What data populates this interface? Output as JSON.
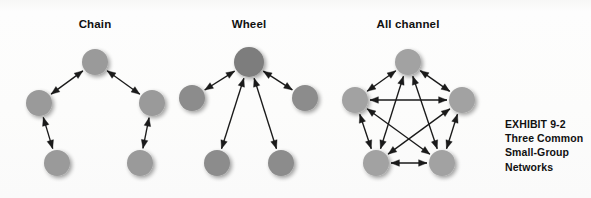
{
  "figure": {
    "caption_lines": [
      "EXHIBIT 9-2",
      "Three Common",
      "Small-Group",
      "Networks"
    ],
    "background_color": "#fbfbfa",
    "node_color": "#9a9a9a",
    "hub_node_color": "#7d7d7d",
    "arrow_color": "#1a1a1a",
    "title_color": "#101010",
    "node_radius": 13,
    "hub_node_radius": 15
  },
  "panels": [
    {
      "id": "chain",
      "title": "Chain",
      "title_x": 95,
      "title_y": 18,
      "nodes": [
        {
          "id": "top",
          "name": "chain-node-top",
          "x": 95,
          "y": 62,
          "r": 13,
          "color": "#9a9a9a"
        },
        {
          "id": "left",
          "name": "chain-node-left",
          "x": 39,
          "y": 103,
          "r": 13,
          "color": "#9a9a9a"
        },
        {
          "id": "right",
          "name": "chain-node-right",
          "x": 152,
          "y": 103,
          "r": 13,
          "color": "#9a9a9a"
        },
        {
          "id": "bottom-left",
          "name": "chain-node-bottom-left",
          "x": 57,
          "y": 163,
          "r": 13,
          "color": "#9a9a9a"
        },
        {
          "id": "bottom-right",
          "name": "chain-node-bottom-right",
          "x": 140,
          "y": 163,
          "r": 13,
          "color": "#9a9a9a"
        }
      ],
      "links": [
        {
          "from": "bottom-left",
          "to": "left",
          "name": "chain-link-bottomleft-left",
          "arrows": "both"
        },
        {
          "from": "left",
          "to": "top",
          "name": "chain-link-left-top",
          "arrows": "both"
        },
        {
          "from": "top",
          "to": "right",
          "name": "chain-link-top-right",
          "arrows": "both"
        },
        {
          "from": "right",
          "to": "bottom-right",
          "name": "chain-link-right-bottomright",
          "arrows": "both"
        }
      ]
    },
    {
      "id": "wheel",
      "title": "Wheel",
      "title_x": 249,
      "title_y": 18,
      "nodes": [
        {
          "id": "hub",
          "name": "wheel-node-hub",
          "x": 249,
          "y": 62,
          "r": 15,
          "color": "#7d7d7d"
        },
        {
          "id": "left",
          "name": "wheel-node-left",
          "x": 192,
          "y": 98,
          "r": 13,
          "color": "#8c8c8c"
        },
        {
          "id": "right",
          "name": "wheel-node-right",
          "x": 305,
          "y": 98,
          "r": 13,
          "color": "#8c8c8c"
        },
        {
          "id": "bottom-left",
          "name": "wheel-node-bottom-left",
          "x": 217,
          "y": 163,
          "r": 13,
          "color": "#8c8c8c"
        },
        {
          "id": "bottom-right",
          "name": "wheel-node-bottom-right",
          "x": 281,
          "y": 163,
          "r": 13,
          "color": "#8c8c8c"
        }
      ],
      "links": [
        {
          "from": "hub",
          "to": "left",
          "name": "wheel-link-hub-left",
          "arrows": "both"
        },
        {
          "from": "hub",
          "to": "right",
          "name": "wheel-link-hub-right",
          "arrows": "both"
        },
        {
          "from": "hub",
          "to": "bottom-left",
          "name": "wheel-link-hub-bottomleft",
          "arrows": "both"
        },
        {
          "from": "hub",
          "to": "bottom-right",
          "name": "wheel-link-hub-bottomright",
          "arrows": "both"
        }
      ]
    },
    {
      "id": "all-channel",
      "title": "All channel",
      "title_x": 408,
      "title_y": 18,
      "nodes": [
        {
          "id": "top",
          "name": "allchannel-node-top",
          "x": 408,
          "y": 62,
          "r": 13,
          "color": "#a2a2a2"
        },
        {
          "id": "left",
          "name": "allchannel-node-left",
          "x": 355,
          "y": 100,
          "r": 13,
          "color": "#a2a2a2"
        },
        {
          "id": "right",
          "name": "allchannel-node-right",
          "x": 462,
          "y": 100,
          "r": 13,
          "color": "#a2a2a2"
        },
        {
          "id": "bottom-left",
          "name": "allchannel-node-bottom-left",
          "x": 376,
          "y": 163,
          "r": 13,
          "color": "#a2a2a2"
        },
        {
          "id": "bottom-right",
          "name": "allchannel-node-bottom-right",
          "x": 442,
          "y": 163,
          "r": 13,
          "color": "#a2a2a2"
        }
      ],
      "links": [
        {
          "from": "top",
          "to": "left",
          "name": "allchannel-link-top-left",
          "arrows": "both"
        },
        {
          "from": "top",
          "to": "right",
          "name": "allchannel-link-top-right",
          "arrows": "both"
        },
        {
          "from": "left",
          "to": "right",
          "name": "allchannel-link-left-right",
          "arrows": "both"
        },
        {
          "from": "left",
          "to": "bottom-left",
          "name": "allchannel-link-left-bottomleft",
          "arrows": "both"
        },
        {
          "from": "right",
          "to": "bottom-right",
          "name": "allchannel-link-right-bottomright",
          "arrows": "both"
        },
        {
          "from": "bottom-left",
          "to": "bottom-right",
          "name": "allchannel-link-bottomleft-bottomright",
          "arrows": "both"
        },
        {
          "from": "top",
          "to": "bottom-left",
          "name": "allchannel-link-top-bottomleft",
          "arrows": "both"
        },
        {
          "from": "top",
          "to": "bottom-right",
          "name": "allchannel-link-top-bottomright",
          "arrows": "both"
        },
        {
          "from": "left",
          "to": "bottom-right",
          "name": "allchannel-link-left-bottomright",
          "arrows": "both"
        },
        {
          "from": "right",
          "to": "bottom-left",
          "name": "allchannel-link-right-bottomleft",
          "arrows": "both"
        }
      ]
    }
  ]
}
